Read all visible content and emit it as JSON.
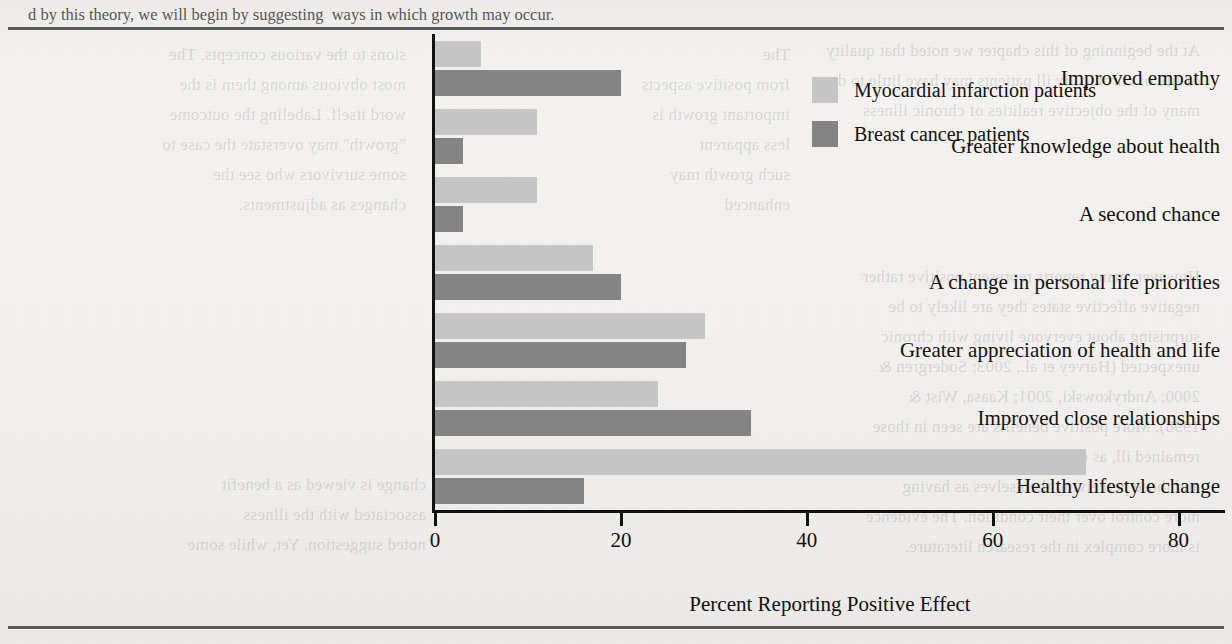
{
  "page": {
    "top_line": "d by this theory, we will begin by suggesting  ways in which growth may occur.",
    "left_column": [
      "sions to the various concepts. The",
      "most obvious among them is the",
      "word itself. Labeling the outcome",
      "\"growth\" may overstate the case to",
      "some survivors who see the",
      "changes as adjustments."
    ],
    "right_column": [
      "At the beginning of this chapter we noted that quality",
      "of life of chronically ill patients may have little to do with",
      "many of the objective realities of chronic illness, but see",
      "and which may well produce a benefit that the",
      "end of the chronic condition is not necessary.",
      "that chronically ill cancer patients as well as those",
      "chronic illness (Taylor, 1983).",
      "",
      "Research on benefit-finding and the",
      "chronic condition can prompt unfavorable outcomes.",
      "However, many reports represent positive rather than",
      "negative affective states they are likely to be equally",
      "surprising about everyone living with chronic illness,",
      "unexpected (Harvey et al., 2003; Sodergren & Hyland,",
      "2000; Andrykowski, 2001; Kaasa, Wist & Kvikstad,",
      "1998). More positive benefits are seen in those who",
      "remained ill, as distinct from those who recovered,",
      "and those perceiving themselves as having",
      "more control over their condition. The evidence",
      "is more complex in the research literature. To",
      "the author is that those who continue to be",
      "chronically ill reported greater benefit."
    ]
  },
  "chart_data": {
    "type": "bar",
    "orientation": "horizontal",
    "title": "",
    "xlabel": "Percent Reporting Positive Effect",
    "ylabel": "",
    "xlim": [
      0,
      85
    ],
    "xticks": [
      0,
      20,
      40,
      60,
      80
    ],
    "xtick_labels": [
      "0",
      "20",
      "40",
      "60",
      "80"
    ],
    "grid": false,
    "legend_position": "top-right",
    "categories": [
      "Improved empathy",
      "Greater knowledge about health",
      "A second chance",
      "A change in personal life priorities",
      "Greater appreciation of health and life",
      "Improved close relationships",
      "Healthy lifestyle change"
    ],
    "series": [
      {
        "name": "Myocardial infarction patients",
        "color": "#c6c6c6",
        "values": [
          5,
          11,
          11,
          17,
          29,
          24,
          70
        ]
      },
      {
        "name": "Breast cancer patients",
        "color": "#848484",
        "values": [
          20,
          3,
          3,
          20,
          27,
          34,
          16
        ]
      }
    ]
  }
}
